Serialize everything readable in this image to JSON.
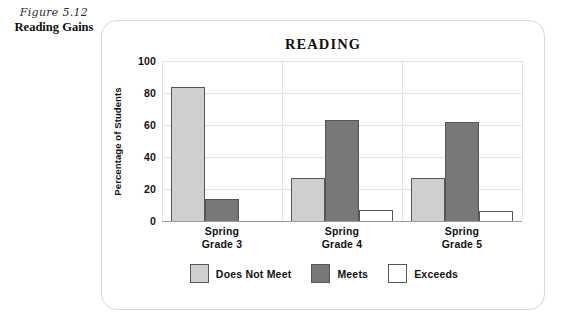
{
  "figure": {
    "number": "Figure 5.12",
    "title": "Reading Gains"
  },
  "chart_data": {
    "type": "bar",
    "title": "READING",
    "xlabel": "",
    "ylabel": "Percentage of Students",
    "ylim": [
      0,
      100
    ],
    "yticks": [
      "0",
      "20",
      "40",
      "60",
      "80",
      "100"
    ],
    "grid": true,
    "legend_position": "bottom",
    "categories": [
      "Spring\nGrade 3",
      "Spring\nGrade 4",
      "Spring\nGrade 5"
    ],
    "category_lines": [
      [
        "Spring",
        "Grade 3"
      ],
      [
        "Spring",
        "Grade 4"
      ],
      [
        "Spring",
        "Grade 5"
      ]
    ],
    "series": [
      {
        "name": "Does Not Meet",
        "color": "#cfcfcf",
        "values": [
          84,
          27,
          27
        ]
      },
      {
        "name": "Meets",
        "color": "#787878",
        "values": [
          14,
          63,
          62
        ]
      },
      {
        "name": "Exceeds",
        "color": "#ffffff",
        "values": [
          0,
          7,
          6
        ]
      }
    ]
  },
  "legend": {
    "items": [
      {
        "label": "Does Not Meet",
        "swatch": "does-not-meet"
      },
      {
        "label": "Meets",
        "swatch": "meets"
      },
      {
        "label": "Exceeds",
        "swatch": "exceeds"
      }
    ]
  },
  "colors": {
    "does_not_meet": "#cfcfcf",
    "meets": "#787878",
    "exceeds": "#ffffff",
    "bar_outline": "#555555",
    "gridline": "#e3e3e3",
    "axis": "#9a9a9a",
    "panel_border": "#d8d8d8",
    "text": "#111111"
  }
}
